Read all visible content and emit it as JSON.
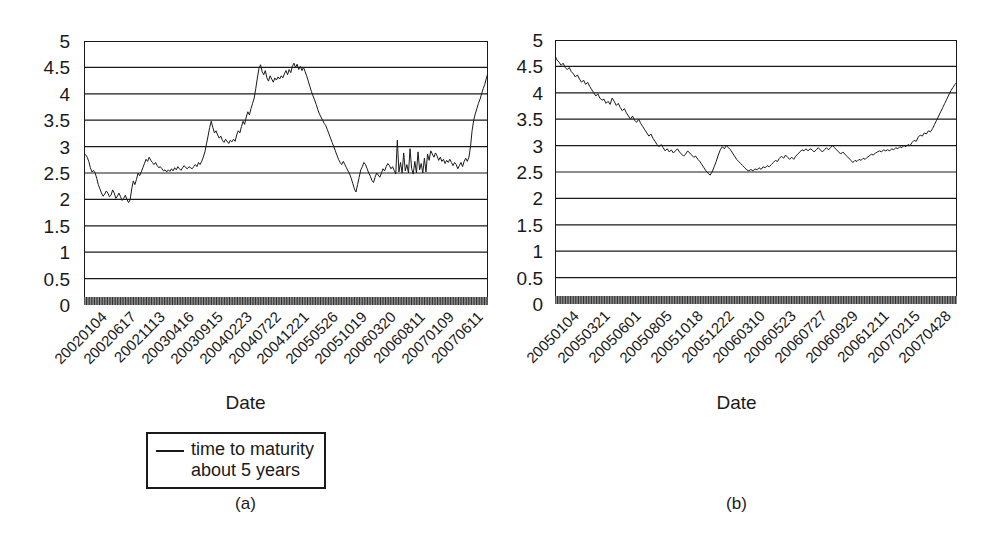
{
  "figure": {
    "background": "#ffffff",
    "line_color": "#1a1a1a",
    "axis_color": "#1a1a1a"
  },
  "chart_data": [
    {
      "type": "line",
      "panel": "a",
      "title": "",
      "subcaption": "(a)",
      "xlabel": "Date",
      "ylabel": "",
      "ylim": [
        0,
        5
      ],
      "yticks": [
        0,
        0.5,
        1,
        1.5,
        2,
        2.5,
        3,
        3.5,
        4,
        4.5,
        5
      ],
      "ytick_labels": [
        "0",
        "0.5",
        "1",
        "1.5",
        "2",
        "2.5",
        "3",
        "3.5",
        "4",
        "4.5",
        "5"
      ],
      "grid": "horizontal",
      "legend_position": "below-axis",
      "legend": [
        "time to maturity\nabout 5 years"
      ],
      "xtick_labels": [
        "20020104",
        "20020617",
        "20021113",
        "20030416",
        "20030915",
        "20040223",
        "20040722",
        "20041221",
        "20050526",
        "20051019",
        "20060320",
        "20060811",
        "20070109",
        "20070611"
      ],
      "series": [
        {
          "name": "time to maturity about 5 years",
          "values": [
            2.88,
            2.85,
            2.8,
            2.72,
            2.6,
            2.52,
            2.55,
            2.5,
            2.4,
            2.28,
            2.2,
            2.12,
            2.06,
            2.1,
            2.16,
            2.12,
            2.05,
            2.08,
            2.18,
            2.12,
            2.02,
            2.06,
            2.12,
            2.05,
            1.98,
            2.02,
            2.08,
            2.0,
            1.94,
            1.99,
            2.2,
            2.35,
            2.28,
            2.38,
            2.5,
            2.45,
            2.52,
            2.6,
            2.68,
            2.76,
            2.72,
            2.8,
            2.74,
            2.7,
            2.66,
            2.7,
            2.64,
            2.6,
            2.62,
            2.58,
            2.54,
            2.56,
            2.52,
            2.56,
            2.53,
            2.58,
            2.54,
            2.6,
            2.56,
            2.62,
            2.58,
            2.55,
            2.6,
            2.64,
            2.6,
            2.58,
            2.62,
            2.6,
            2.58,
            2.62,
            2.66,
            2.62,
            2.7,
            2.66,
            2.72,
            2.8,
            2.9,
            3.05,
            3.2,
            3.36,
            3.48,
            3.36,
            3.26,
            3.3,
            3.22,
            3.16,
            3.2,
            3.12,
            3.08,
            3.14,
            3.1,
            3.06,
            3.12,
            3.09,
            3.14,
            3.1,
            3.22,
            3.3,
            3.26,
            3.38,
            3.48,
            3.42,
            3.56,
            3.66,
            3.6,
            3.72,
            3.82,
            3.92,
            4.1,
            4.3,
            4.48,
            4.55,
            4.42,
            4.36,
            4.44,
            4.3,
            4.24,
            4.34,
            4.28,
            4.22,
            4.3,
            4.26,
            4.32,
            4.28,
            4.34,
            4.3,
            4.38,
            4.44,
            4.36,
            4.46,
            4.4,
            4.52,
            4.58,
            4.5,
            4.56,
            4.46,
            4.52,
            4.44,
            4.5,
            4.42,
            4.34,
            4.24,
            4.14,
            4.04,
            3.96,
            3.88,
            3.8,
            3.7,
            3.62,
            3.56,
            3.5,
            3.44,
            3.4,
            3.32,
            3.24,
            3.16,
            3.08,
            3.0,
            2.92,
            2.84,
            2.76,
            2.7,
            2.66,
            2.72,
            2.66,
            2.6,
            2.54,
            2.48,
            2.4,
            2.3,
            2.2,
            2.14,
            2.28,
            2.42,
            2.56,
            2.62,
            2.7,
            2.66,
            2.58,
            2.5,
            2.44,
            2.36,
            2.32,
            2.42,
            2.5,
            2.46,
            2.42,
            2.5,
            2.58,
            2.54,
            2.62,
            2.68,
            2.64,
            2.58,
            2.62,
            2.55,
            2.48,
            3.12,
            2.52,
            2.7,
            2.5,
            2.88,
            2.54,
            2.66,
            2.5,
            2.96,
            2.58,
            2.48,
            2.72,
            2.5,
            2.9,
            2.56,
            2.68,
            2.5,
            2.78,
            2.52,
            2.86,
            2.74,
            2.92,
            2.86,
            2.8,
            2.88,
            2.82,
            2.74,
            2.8,
            2.72,
            2.76,
            2.68,
            2.74,
            2.7,
            2.76,
            2.7,
            2.64,
            2.7,
            2.66,
            2.58,
            2.64,
            2.7,
            2.62,
            2.72,
            2.78,
            2.72,
            2.8,
            3.0,
            3.3,
            3.5,
            3.62,
            3.72,
            3.82,
            3.9,
            4.0,
            4.1,
            4.18,
            4.3,
            4.4
          ]
        }
      ]
    },
    {
      "type": "line",
      "panel": "b",
      "title": "",
      "subcaption": "(b)",
      "xlabel": "Date",
      "ylabel": "",
      "ylim": [
        0,
        5
      ],
      "yticks": [
        0,
        0.5,
        1,
        1.5,
        2,
        2.5,
        3,
        3.5,
        4,
        4.5,
        5
      ],
      "ytick_labels": [
        "0",
        "0.5",
        "1",
        "1.5",
        "2",
        "2.5",
        "3",
        "3.5",
        "4",
        "4.5",
        "5"
      ],
      "grid": "horizontal",
      "legend_position": "below-axis",
      "legend": [
        "time to maturity\n5 years"
      ],
      "xtick_labels": [
        "20050104",
        "20050321",
        "20050601",
        "20050805",
        "20051018",
        "20051222",
        "20060310",
        "20060523",
        "20060727",
        "20060929",
        "20061211",
        "20070215",
        "20070428"
      ],
      "series": [
        {
          "name": "time to maturity 5 years",
          "values": [
            4.7,
            4.62,
            4.58,
            4.52,
            4.56,
            4.48,
            4.44,
            4.48,
            4.4,
            4.36,
            4.3,
            4.34,
            4.26,
            4.2,
            4.24,
            4.16,
            4.2,
            4.12,
            4.06,
            4.0,
            3.94,
            3.98,
            3.9,
            3.86,
            3.88,
            3.8,
            3.84,
            3.78,
            3.9,
            3.84,
            3.76,
            3.8,
            3.72,
            3.66,
            3.7,
            3.62,
            3.56,
            3.5,
            3.56,
            3.48,
            3.44,
            3.5,
            3.42,
            3.36,
            3.3,
            3.24,
            3.18,
            3.22,
            3.14,
            3.08,
            3.02,
            2.98,
            3.02,
            2.96,
            2.9,
            2.94,
            2.88,
            2.92,
            2.86,
            2.9,
            2.94,
            2.88,
            2.84,
            2.8,
            2.84,
            2.9,
            2.86,
            2.82,
            2.78,
            2.8,
            2.74,
            2.7,
            2.64,
            2.58,
            2.52,
            2.48,
            2.44,
            2.5,
            2.6,
            2.7,
            2.82,
            2.92,
            2.98,
            2.94,
            3.0,
            2.96,
            2.92,
            2.86,
            2.8,
            2.74,
            2.7,
            2.66,
            2.62,
            2.58,
            2.54,
            2.52,
            2.55,
            2.52,
            2.56,
            2.54,
            2.58,
            2.55,
            2.6,
            2.58,
            2.62,
            2.6,
            2.64,
            2.68,
            2.72,
            2.7,
            2.76,
            2.8,
            2.76,
            2.82,
            2.78,
            2.74,
            2.78,
            2.74,
            2.8,
            2.84,
            2.88,
            2.92,
            2.9,
            2.94,
            2.9,
            2.94,
            2.92,
            2.88,
            2.92,
            2.96,
            2.92,
            2.88,
            2.92,
            2.96,
            2.92,
            2.96,
            3.0,
            2.96,
            2.92,
            2.88,
            2.84,
            2.88,
            2.84,
            2.8,
            2.76,
            2.72,
            2.68,
            2.72,
            2.7,
            2.74,
            2.72,
            2.76,
            2.74,
            2.78,
            2.8,
            2.84,
            2.82,
            2.86,
            2.88,
            2.9,
            2.88,
            2.92,
            2.9,
            2.92,
            2.9,
            2.94,
            2.92,
            2.96,
            2.94,
            2.98,
            2.96,
            3.0,
            2.98,
            3.02,
            3.0,
            3.06,
            3.1,
            3.08,
            3.16,
            3.2,
            3.18,
            3.24,
            3.22,
            3.28,
            3.26,
            3.32,
            3.4,
            3.48,
            3.56,
            3.64,
            3.72,
            3.8,
            3.88,
            3.96,
            4.04,
            4.1,
            4.16,
            4.2
          ]
        }
      ]
    }
  ]
}
